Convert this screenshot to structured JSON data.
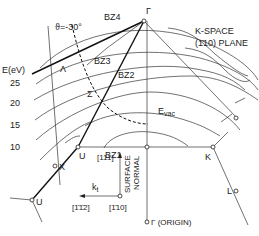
{
  "diagram": {
    "labels": {
      "theta": "ϑ=-30°",
      "energy_axis": "E(eV)",
      "energy_ticks": [
        "25",
        "20",
        "15",
        "10"
      ],
      "lambda": "Λ",
      "sigma": "Σ",
      "bz4": "BZ4",
      "bz3": "BZ3",
      "bz2": "BZ2",
      "bz1": "BZ1",
      "gamma_top": "Γ",
      "kspace_line1": "K-SPACE",
      "kspace_line2": "(1̄10) PLANE",
      "evac": "E",
      "evac_sub": "vac",
      "u_upper": "U",
      "u_lower": "U",
      "x_point": "X",
      "k_point": "K",
      "l_point": "L",
      "dir_111": "[111]",
      "dir_112": "[1̄1̄2]",
      "dir_110": "[1̄10]",
      "kt": "k",
      "kt_sub": "t",
      "surface": "SURFACE",
      "normal": "NORMAL",
      "gamma_origin": "Γ (ORIGIN)"
    },
    "colors": {
      "ink": "#111111",
      "background": "#ffffff"
    }
  }
}
